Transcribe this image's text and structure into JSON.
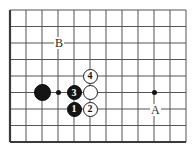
{
  "figure": {
    "type": "go-board",
    "background_color": "#ffffff",
    "line_color": "#555555",
    "border_color": "#3a3a3a",
    "black_color": "#141414",
    "white_color": "#ffffff"
  },
  "board": {
    "left": 10,
    "top": 10,
    "right": 186,
    "bottom": 142,
    "cols": 12,
    "rows": 9,
    "col_x": [
      10,
      26,
      42,
      58,
      74,
      90,
      106,
      122,
      138,
      154,
      170,
      186
    ],
    "row_y": [
      10,
      26.5,
      43,
      59.5,
      76,
      92.5,
      109,
      125.5,
      142
    ]
  },
  "hoshi_points": [
    {
      "name": "hoshi-left",
      "x": 58,
      "y": 92.5
    },
    {
      "name": "hoshi-right",
      "x": 154,
      "y": 92.5
    }
  ],
  "stones": [
    {
      "id": "black-plain",
      "color": "black",
      "label": "",
      "x": 42,
      "y": 92.5,
      "size": "big"
    },
    {
      "id": "black-3",
      "color": "black",
      "label": "3",
      "x": 74,
      "y": 92.5,
      "size": "num"
    },
    {
      "id": "white-plain",
      "color": "white",
      "label": "",
      "x": 90,
      "y": 92.5,
      "size": "num"
    },
    {
      "id": "white-4",
      "color": "white",
      "label": "4",
      "x": 90,
      "y": 76,
      "size": "num"
    },
    {
      "id": "black-1",
      "color": "black",
      "label": "1",
      "x": 74,
      "y": 109,
      "size": "num"
    },
    {
      "id": "white-2",
      "color": "white",
      "label": "2",
      "x": 90,
      "y": 109,
      "size": "num"
    }
  ],
  "markers": [
    {
      "id": "marker-b",
      "label": "B",
      "x": 58,
      "y": 43,
      "anchor": "center"
    },
    {
      "id": "marker-a",
      "label": "A",
      "x": 154,
      "y": 110,
      "anchor": "center"
    }
  ]
}
